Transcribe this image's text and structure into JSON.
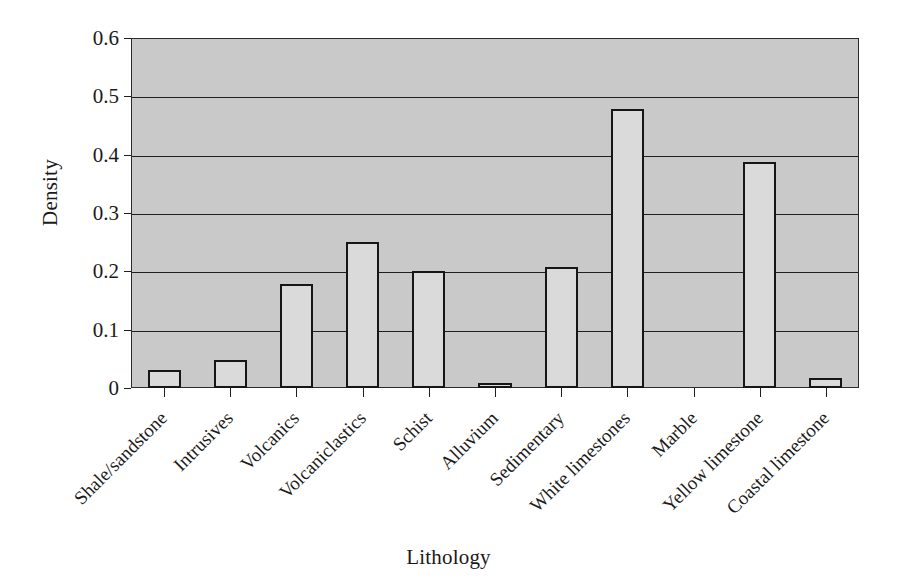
{
  "chart_data": {
    "type": "bar",
    "title": "",
    "xlabel": "Lithology",
    "ylabel": "Density",
    "ylim": [
      0,
      0.6
    ],
    "ytick_labels": [
      "0",
      "0.1",
      "0.2",
      "0.3",
      "0.4",
      "0.5",
      "0.6"
    ],
    "ytick_values": [
      0,
      0.1,
      0.2,
      0.3,
      0.4,
      0.5,
      0.6
    ],
    "grid": "horizontal",
    "legend": "none",
    "plot_background": "#c9c9c9",
    "bar_fill": "#dadada",
    "bar_edge": "#161616",
    "categories": [
      "Shale/sandstone",
      "Intrusives",
      "Volcanics",
      "Volcaniclastics",
      "Schist",
      "Alluvium",
      "Sedimentary",
      "White limestones",
      "Marble",
      "Yellow limestone",
      "Coastal limestone"
    ],
    "values": [
      0.031,
      0.048,
      0.179,
      0.25,
      0.2,
      0.008,
      0.208,
      0.479,
      0,
      0.388,
      0.018
    ]
  },
  "axes": {
    "y_title": "Density",
    "x_title": "Lithology"
  }
}
